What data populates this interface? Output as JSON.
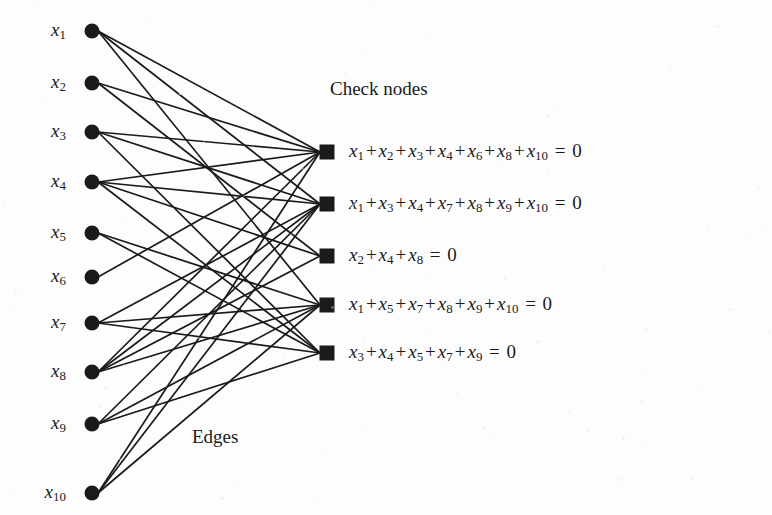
{
  "figure": {
    "type": "tanner-graph",
    "background_color": "#fdfdfd",
    "ink_color": "#1a1a1a",
    "width": 772,
    "height": 515
  },
  "captions": {
    "check_nodes": "Check nodes",
    "edges": "Edges"
  },
  "variable_nodes": [
    {
      "id": "x1",
      "label": "x",
      "sub": "1",
      "x": 92,
      "y": 31,
      "shape": "circle"
    },
    {
      "id": "x2",
      "label": "x",
      "sub": "2",
      "x": 92,
      "y": 83,
      "shape": "circle"
    },
    {
      "id": "x3",
      "label": "x",
      "sub": "3",
      "x": 92,
      "y": 132,
      "shape": "circle"
    },
    {
      "id": "x4",
      "label": "x",
      "sub": "4",
      "x": 92,
      "y": 182,
      "shape": "circle"
    },
    {
      "id": "x5",
      "label": "x",
      "sub": "5",
      "x": 92,
      "y": 233,
      "shape": "circle"
    },
    {
      "id": "x6",
      "label": "x",
      "sub": "6",
      "x": 92,
      "y": 277,
      "shape": "circle"
    },
    {
      "id": "x7",
      "label": "x",
      "sub": "7",
      "x": 92,
      "y": 323,
      "shape": "circle"
    },
    {
      "id": "x8",
      "label": "x",
      "sub": "8",
      "x": 92,
      "y": 372,
      "shape": "circle"
    },
    {
      "id": "x9",
      "label": "x",
      "sub": "9",
      "x": 92,
      "y": 424,
      "shape": "circle"
    },
    {
      "id": "x10",
      "label": "x",
      "sub": "10",
      "x": 92,
      "y": 493,
      "shape": "circle"
    }
  ],
  "check_nodes": [
    {
      "id": "c1",
      "x": 327,
      "y": 152,
      "shape": "square",
      "connects": [
        "x1",
        "x2",
        "x3",
        "x4",
        "x6",
        "x8",
        "x10"
      ],
      "equation_terms": [
        "1",
        "2",
        "3",
        "4",
        "6",
        "8",
        "10"
      ],
      "equation_text": "x1 + x2 + x3 + x4 + x6 + x8 + x10 = 0"
    },
    {
      "id": "c2",
      "x": 327,
      "y": 204,
      "shape": "square",
      "connects": [
        "x1",
        "x3",
        "x4",
        "x7",
        "x8",
        "x9",
        "x10"
      ],
      "equation_terms": [
        "1",
        "3",
        "4",
        "7",
        "8",
        "9",
        "10"
      ],
      "equation_text": "x1 + x3 + x4 + x7 + x8 + x9 + x10 = 0"
    },
    {
      "id": "c3",
      "x": 327,
      "y": 256,
      "shape": "square",
      "connects": [
        "x2",
        "x4",
        "x8"
      ],
      "equation_terms": [
        "2",
        "4",
        "8"
      ],
      "equation_text": "x2 + x4 + x8 = 0"
    },
    {
      "id": "c4",
      "x": 327,
      "y": 305,
      "shape": "square",
      "connects": [
        "x1",
        "x5",
        "x7",
        "x8",
        "x9",
        "x10"
      ],
      "equation_terms": [
        "1",
        "5",
        "7",
        "8",
        "9",
        "10"
      ],
      "equation_text": "x1 + x5 + x7 + x8 + x9 + x10 = 0"
    },
    {
      "id": "c5",
      "x": 327,
      "y": 353,
      "shape": "square",
      "connects": [
        "x3",
        "x4",
        "x5",
        "x7",
        "x9"
      ],
      "equation_terms": [
        "3",
        "4",
        "5",
        "7",
        "9"
      ],
      "equation_text": "x3 + x4 + x5 + x7 + x9 = 0"
    }
  ],
  "caption_positions": {
    "check_nodes": {
      "x": 330,
      "y": 89
    },
    "edges": {
      "x": 192,
      "y": 437
    }
  },
  "equation_x": 349,
  "symbols": {
    "plus": "+",
    "equals": "=",
    "zero": "0"
  }
}
